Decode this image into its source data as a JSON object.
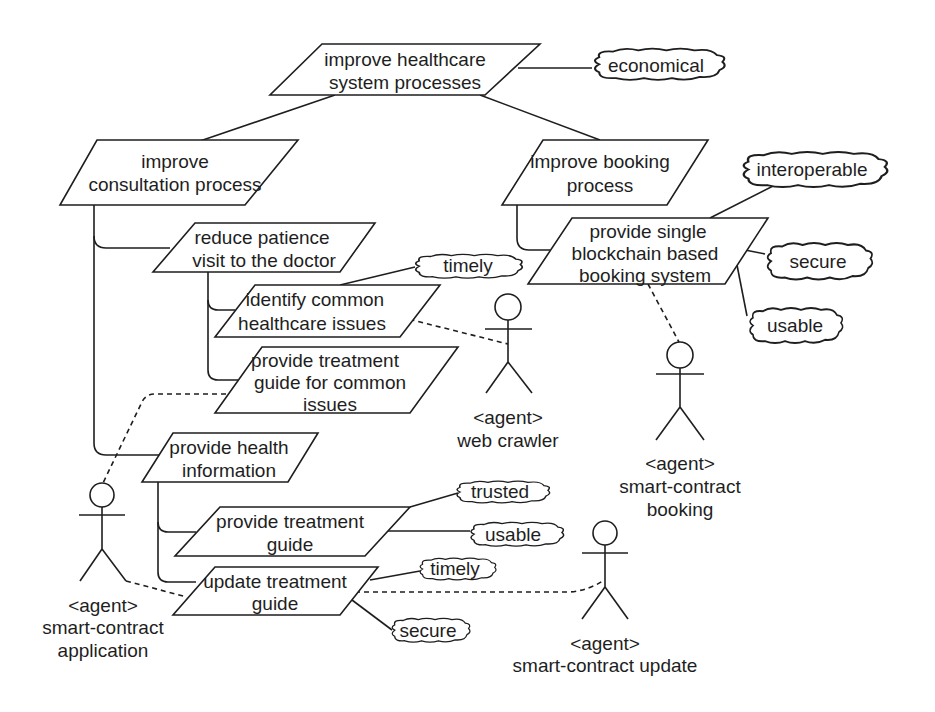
{
  "goals": {
    "root": [
      "improve healthcare",
      "system processes"
    ],
    "consultation": [
      "improve",
      "consultation process"
    ],
    "booking": [
      "improve booking",
      "process"
    ],
    "reduce_visit": [
      "reduce patience",
      "visit to the doctor"
    ],
    "identify_issues": [
      "identify common",
      "healthcare issues"
    ],
    "treatment_common": [
      "provide treatment",
      "guide for common",
      "issues"
    ],
    "health_info": [
      "provide health",
      "information"
    ],
    "treatment_guide": [
      "provide treatment",
      "guide"
    ],
    "update_guide": [
      "update treatment",
      "guide"
    ],
    "single_booking": [
      "provide single",
      "blockchain based",
      "booking system"
    ]
  },
  "softgoals": {
    "economical": "economical",
    "timely_upper": "timely",
    "interoperable": "interoperable",
    "secure_booking": "secure",
    "usable_booking": "usable",
    "trusted": "trusted",
    "usable_guide": "usable",
    "timely_lower": "timely",
    "secure_lower": "secure"
  },
  "actors": {
    "web_crawler": [
      "<agent>",
      "web crawler"
    ],
    "booking": [
      "<agent>",
      "smart-contract",
      "booking"
    ],
    "application": [
      "<agent>",
      "smart-contract",
      "application"
    ],
    "update": [
      "<agent>",
      "smart-contract update"
    ]
  }
}
